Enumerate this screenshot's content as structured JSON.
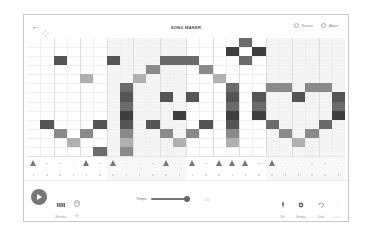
{
  "header": {
    "title": "SONG MAKER",
    "back_icon": "arrow-left-icon",
    "move_icon": "move-arrows-icon",
    "restart_label": "Restart",
    "about_label": "About"
  },
  "grid": {
    "columns": 24,
    "melody_rows": 13,
    "shaded_column_groups": [
      [
        6,
        11
      ],
      [
        18,
        23
      ]
    ],
    "colors": {
      "darkest": "#3f3f3f",
      "dark": "#555555",
      "medium_dark": "#6b6b6b",
      "medium": "#8a8a8a",
      "light": "#b0b0b0",
      "shade_bg": "#f4f4f4"
    },
    "notes": [
      {
        "col": 16,
        "row": 0,
        "shade": "medium_dark"
      },
      {
        "col": 15,
        "row": 1,
        "shade": "darkest"
      },
      {
        "col": 17,
        "row": 1,
        "shade": "darkest"
      },
      {
        "col": 16,
        "row": 2,
        "shade": "medium_dark"
      },
      {
        "col": 2,
        "row": 2,
        "shade": "dark"
      },
      {
        "col": 6,
        "row": 2,
        "shade": "dark"
      },
      {
        "col": 10,
        "row": 2,
        "shade": "medium_dark"
      },
      {
        "col": 11,
        "row": 2,
        "shade": "medium_dark"
      },
      {
        "col": 12,
        "row": 2,
        "shade": "medium_dark"
      },
      {
        "col": 9,
        "row": 3,
        "shade": "medium"
      },
      {
        "col": 13,
        "row": 3,
        "shade": "medium"
      },
      {
        "col": 4,
        "row": 4,
        "shade": "light"
      },
      {
        "col": 8,
        "row": 4,
        "shade": "light"
      },
      {
        "col": 14,
        "row": 4,
        "shade": "light"
      },
      {
        "col": 7,
        "row": 5,
        "shade": "medium_dark"
      },
      {
        "col": 7,
        "row": 6,
        "shade": "dark"
      },
      {
        "col": 7,
        "row": 7,
        "shade": "medium_dark"
      },
      {
        "col": 7,
        "row": 8,
        "shade": "darkest"
      },
      {
        "col": 7,
        "row": 9,
        "shade": "dark"
      },
      {
        "col": 7,
        "row": 10,
        "shade": "medium"
      },
      {
        "col": 7,
        "row": 11,
        "shade": "light"
      },
      {
        "col": 7,
        "row": 12,
        "shade": "medium"
      },
      {
        "col": 15,
        "row": 5,
        "shade": "medium_dark"
      },
      {
        "col": 15,
        "row": 6,
        "shade": "dark"
      },
      {
        "col": 15,
        "row": 7,
        "shade": "medium_dark"
      },
      {
        "col": 15,
        "row": 8,
        "shade": "darkest"
      },
      {
        "col": 15,
        "row": 9,
        "shade": "dark"
      },
      {
        "col": 15,
        "row": 10,
        "shade": "medium"
      },
      {
        "col": 15,
        "row": 11,
        "shade": "light"
      },
      {
        "col": 10,
        "row": 6,
        "shade": "dark"
      },
      {
        "col": 12,
        "row": 6,
        "shade": "dark"
      },
      {
        "col": 11,
        "row": 8,
        "shade": "darkest"
      },
      {
        "col": 9,
        "row": 9,
        "shade": "dark"
      },
      {
        "col": 13,
        "row": 9,
        "shade": "dark"
      },
      {
        "col": 10,
        "row": 10,
        "shade": "medium"
      },
      {
        "col": 12,
        "row": 10,
        "shade": "medium"
      },
      {
        "col": 11,
        "row": 11,
        "shade": "light"
      },
      {
        "col": 1,
        "row": 9,
        "shade": "dark"
      },
      {
        "col": 5,
        "row": 9,
        "shade": "dark"
      },
      {
        "col": 2,
        "row": 10,
        "shade": "medium"
      },
      {
        "col": 4,
        "row": 10,
        "shade": "medium"
      },
      {
        "col": 3,
        "row": 11,
        "shade": "light"
      },
      {
        "col": 5,
        "row": 12,
        "shade": "medium_dark"
      },
      {
        "col": 18,
        "row": 5,
        "shade": "medium"
      },
      {
        "col": 19,
        "row": 5,
        "shade": "medium"
      },
      {
        "col": 21,
        "row": 5,
        "shade": "medium"
      },
      {
        "col": 22,
        "row": 5,
        "shade": "medium"
      },
      {
        "col": 17,
        "row": 6,
        "shade": "dark"
      },
      {
        "col": 20,
        "row": 6,
        "shade": "dark"
      },
      {
        "col": 23,
        "row": 6,
        "shade": "dark"
      },
      {
        "col": 17,
        "row": 7,
        "shade": "medium_dark"
      },
      {
        "col": 23,
        "row": 7,
        "shade": "medium_dark"
      },
      {
        "col": 17,
        "row": 8,
        "shade": "darkest"
      },
      {
        "col": 23,
        "row": 8,
        "shade": "darkest"
      },
      {
        "col": 18,
        "row": 9,
        "shade": "medium_dark"
      },
      {
        "col": 22,
        "row": 9,
        "shade": "medium_dark"
      },
      {
        "col": 19,
        "row": 10,
        "shade": "medium"
      },
      {
        "col": 21,
        "row": 10,
        "shade": "medium"
      },
      {
        "col": 20,
        "row": 11,
        "shade": "light"
      }
    ],
    "percussion": {
      "triangle_columns": [
        0,
        4,
        6,
        10,
        12,
        14,
        15,
        16,
        18
      ],
      "circle_columns": []
    }
  },
  "toolbar": {
    "play_icon": "play-icon",
    "instrument_label": "Marimba",
    "percussion_label": "Kit",
    "tempo_label": "Tempo",
    "tempo_value": "120",
    "mic_label": "Mic",
    "settings_label": "Settings",
    "undo_label": "Undo",
    "save_label": "Save"
  }
}
